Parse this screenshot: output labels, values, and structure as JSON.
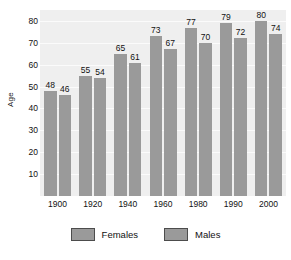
{
  "chart_data": {
    "type": "bar",
    "title": "",
    "xlabel": "",
    "ylabel": "Age",
    "categories": [
      "1900",
      "1920",
      "1940",
      "1960",
      "1980",
      "1990",
      "2000"
    ],
    "series": [
      {
        "name": "Females",
        "values": [
          48,
          55,
          65,
          73,
          77,
          79,
          80
        ],
        "color": "#9a9a9a"
      },
      {
        "name": "Males",
        "values": [
          46,
          54,
          61,
          67,
          70,
          72,
          74
        ],
        "color": "#9a9a9a"
      }
    ],
    "ylim": [
      0,
      85
    ],
    "yticks": [
      10,
      20,
      30,
      40,
      50,
      60,
      70,
      80
    ],
    "ytick_labels": [
      "10",
      "20",
      "30",
      "40",
      "50",
      "60",
      "70",
      "80"
    ],
    "grid": true,
    "grid_axis": "y",
    "grid_color": "#fbfbfb",
    "plot_background": "#efefef",
    "figure_background": "#ffffff",
    "legend_position": "bottom",
    "value_labels_shown": true
  },
  "legend": {
    "entries": [
      {
        "label": "Females",
        "swatch_color": "#9a9a9a",
        "swatch_border": "#4c4c4c"
      },
      {
        "label": "Males",
        "swatch_color": "#9a9a9a",
        "swatch_border": "#4c4c4c"
      }
    ]
  }
}
